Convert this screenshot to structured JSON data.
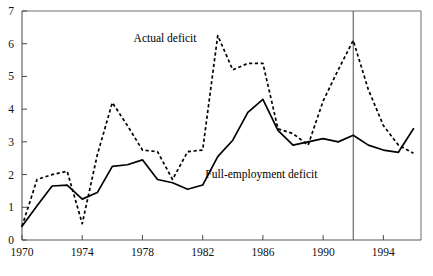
{
  "chart_data": {
    "type": "line",
    "title": "",
    "subtitle": "",
    "xlabel": "",
    "ylabel": "",
    "xlim": [
      1970,
      1996.5
    ],
    "ylim": [
      0,
      7
    ],
    "grid": false,
    "legend_position": "inline-annotation",
    "x_ticks": [
      "1970",
      "1974",
      "1978",
      "1982",
      "1986",
      "1990",
      "1994"
    ],
    "x_tick_values": [
      1970,
      1974,
      1978,
      1982,
      1986,
      1990,
      1994
    ],
    "y_ticks": [
      "0",
      "1",
      "2",
      "3",
      "4",
      "5",
      "6",
      "7"
    ],
    "y_tick_values": [
      0,
      1,
      2,
      3,
      4,
      5,
      6,
      7
    ],
    "x": [
      1970,
      1971,
      1972,
      1973,
      1974,
      1975,
      1976,
      1977,
      1978,
      1979,
      1980,
      1981,
      1982,
      1983,
      1984,
      1985,
      1986,
      1987,
      1988,
      1989,
      1990,
      1991,
      1992,
      1993,
      1994,
      1995,
      1996
    ],
    "series": [
      {
        "name": "Actual deficit",
        "style": "dashed",
        "color": "#000000",
        "values": [
          0.42,
          1.85,
          2.0,
          2.1,
          0.5,
          2.6,
          4.2,
          3.5,
          2.75,
          2.7,
          1.85,
          2.7,
          2.75,
          6.25,
          5.2,
          5.4,
          5.4,
          3.4,
          3.25,
          2.9,
          4.25,
          5.2,
          6.1,
          4.6,
          3.5,
          2.9,
          2.65
        ],
        "annotation": {
          "text": "Actual deficit",
          "x": 1979.5,
          "y": 6.05
        }
      },
      {
        "name": "Full-employment deficit",
        "style": "solid",
        "color": "#000000",
        "values": [
          0.42,
          1.05,
          1.65,
          1.68,
          1.25,
          1.45,
          2.25,
          2.3,
          2.45,
          1.85,
          1.75,
          1.55,
          1.68,
          2.55,
          3.05,
          3.9,
          4.3,
          3.35,
          2.9,
          3.0,
          3.1,
          3.0,
          3.2,
          2.9,
          2.75,
          2.68,
          3.4
        ],
        "annotation": {
          "text": "Full-employment deficit",
          "x": 1985.9,
          "y": 1.9
        }
      }
    ],
    "reference_lines": [
      {
        "orientation": "vertical",
        "x": 1992,
        "label": ""
      }
    ]
  }
}
